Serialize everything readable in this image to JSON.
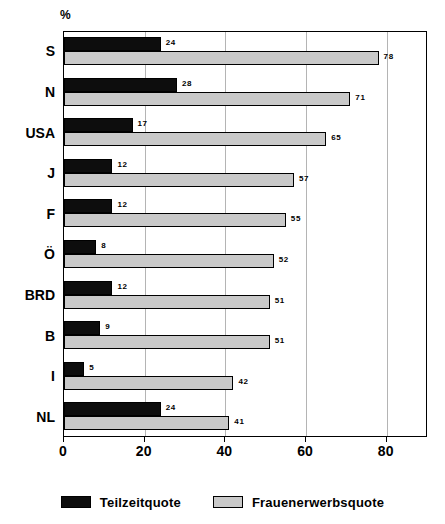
{
  "axis_unit_label": "%",
  "chart_data": {
    "type": "bar",
    "orientation": "horizontal",
    "title": "",
    "subtitle": "",
    "xlabel": "%",
    "ylabel": "",
    "xlim": [
      0,
      90
    ],
    "xticks": [
      0,
      20,
      40,
      60,
      80
    ],
    "xtick_labels": [
      "0",
      "20",
      "40",
      "60",
      "80"
    ],
    "grid": true,
    "grid_axis": "x",
    "legend_position": "bottom",
    "categories": [
      "S",
      "N",
      "USA",
      "J",
      "F",
      "Ö",
      "BRD",
      "B",
      "I",
      "NL"
    ],
    "series": [
      {
        "name": "Teilzeitquote",
        "color": "#0d0d0d",
        "values": [
          24,
          28,
          17,
          12,
          12,
          8,
          12,
          9,
          5,
          24
        ]
      },
      {
        "name": "Frauenerwerbsquote",
        "color": "#c9c9c9",
        "values": [
          78,
          71,
          65,
          57,
          55,
          52,
          51,
          51,
          42,
          41
        ]
      }
    ]
  },
  "legend": {
    "items": [
      {
        "label": "Teilzeitquote",
        "swatch": "black"
      },
      {
        "label": "Frauenerwerbsquote",
        "swatch": "gray"
      }
    ]
  }
}
